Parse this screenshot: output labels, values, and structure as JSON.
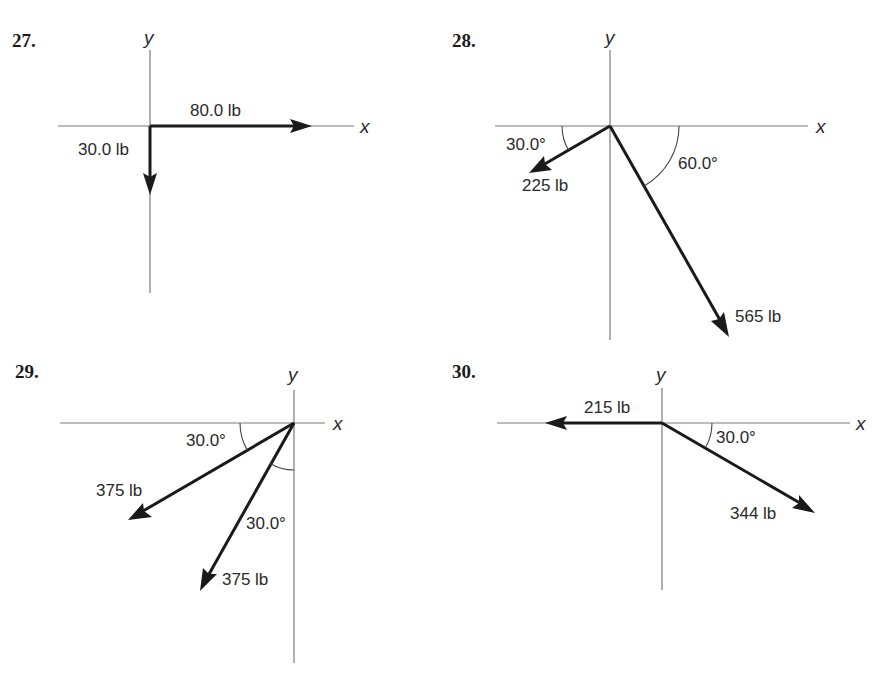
{
  "problems": [
    {
      "number": "27.",
      "axis_x": "x",
      "axis_y": "y",
      "vectors": [
        {
          "label": "80.0 lb",
          "magnitude_lb": 80.0,
          "direction": "positive x-axis (0°)"
        },
        {
          "label": "30.0 lb",
          "magnitude_lb": 30.0,
          "direction": "negative y-axis (270°)"
        }
      ],
      "angles": []
    },
    {
      "number": "28.",
      "axis_x": "x",
      "axis_y": "y",
      "vectors": [
        {
          "label": "225 lb",
          "magnitude_lb": 225,
          "direction": "30.0° below negative x-axis"
        },
        {
          "label": "565 lb",
          "magnitude_lb": 565,
          "direction": "60.0° below positive x-axis"
        }
      ],
      "angles": [
        {
          "label": "30.0°"
        },
        {
          "label": "60.0°"
        }
      ]
    },
    {
      "number": "29.",
      "axis_x": "x",
      "axis_y": "y",
      "vectors": [
        {
          "label": "375 lb",
          "magnitude_lb": 375,
          "direction": "30.0° below negative x-axis"
        },
        {
          "label": "375 lb",
          "magnitude_lb": 375,
          "direction": "30.0° left of negative y-axis"
        }
      ],
      "angles": [
        {
          "label": "30.0°"
        },
        {
          "label": "30.0°"
        }
      ]
    },
    {
      "number": "30.",
      "axis_x": "x",
      "axis_y": "y",
      "vectors": [
        {
          "label": "215 lb",
          "magnitude_lb": 215,
          "direction": "negative x-axis (180°)"
        },
        {
          "label": "344 lb",
          "magnitude_lb": 344,
          "direction": "30.0° below positive x-axis"
        }
      ],
      "angles": [
        {
          "label": "30.0°"
        }
      ]
    }
  ]
}
